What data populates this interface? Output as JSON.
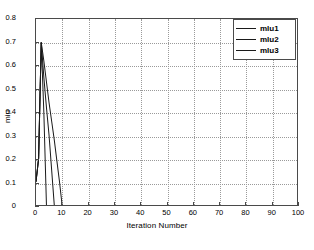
{
  "chart_data": {
    "type": "line",
    "title": "",
    "xlabel": "Iteration Number",
    "ylabel": "miu",
    "xlim": [
      0,
      100
    ],
    "ylim": [
      0,
      0.8
    ],
    "xticks": [
      0,
      10,
      20,
      30,
      40,
      50,
      60,
      70,
      80,
      90,
      100
    ],
    "yticks": [
      0,
      0.1,
      0.2,
      0.3,
      0.4,
      0.5,
      0.6,
      0.7,
      0.8
    ],
    "grid": true,
    "legend_position": "top-right",
    "line_color": "#1a1a1a",
    "axis_color": "#4a4a4a",
    "grid_color": "#9a9a9a",
    "series": [
      {
        "name": "mlu1",
        "x": [
          0,
          1,
          2,
          3,
          4
        ],
        "values": [
          0.1,
          0.2,
          0.7,
          0.4,
          0.0
        ]
      },
      {
        "name": "mlu2",
        "x": [
          0,
          1,
          2,
          3,
          4,
          5,
          6,
          7
        ],
        "values": [
          0.1,
          0.2,
          0.7,
          0.55,
          0.42,
          0.3,
          0.15,
          0.0
        ]
      },
      {
        "name": "mlu3",
        "x": [
          0,
          1,
          2,
          3,
          4,
          5,
          6,
          7,
          8,
          9,
          10
        ],
        "values": [
          0.1,
          0.2,
          0.7,
          0.62,
          0.53,
          0.44,
          0.36,
          0.28,
          0.19,
          0.1,
          0.0
        ]
      }
    ]
  },
  "legend": {
    "items": [
      {
        "label": "mlu1"
      },
      {
        "label": "mlu2"
      },
      {
        "label": "mlu3"
      }
    ]
  }
}
